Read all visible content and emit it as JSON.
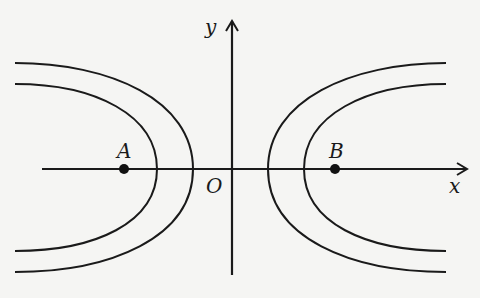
{
  "diagram": {
    "axes": {
      "x_label": "x",
      "y_label": "y",
      "origin_label": "O"
    },
    "points": [
      {
        "name": "A",
        "position": "left of origin on x-axis"
      },
      {
        "name": "B",
        "position": "right of origin on x-axis"
      }
    ],
    "curves": [
      {
        "name": "left-outer-curve",
        "side": "left"
      },
      {
        "name": "left-inner-curve",
        "side": "left"
      },
      {
        "name": "right-outer-curve",
        "side": "right"
      },
      {
        "name": "right-inner-curve",
        "side": "right"
      }
    ],
    "colors": {
      "stroke": "#1a1a1a",
      "background": "#f5f5f3"
    }
  }
}
